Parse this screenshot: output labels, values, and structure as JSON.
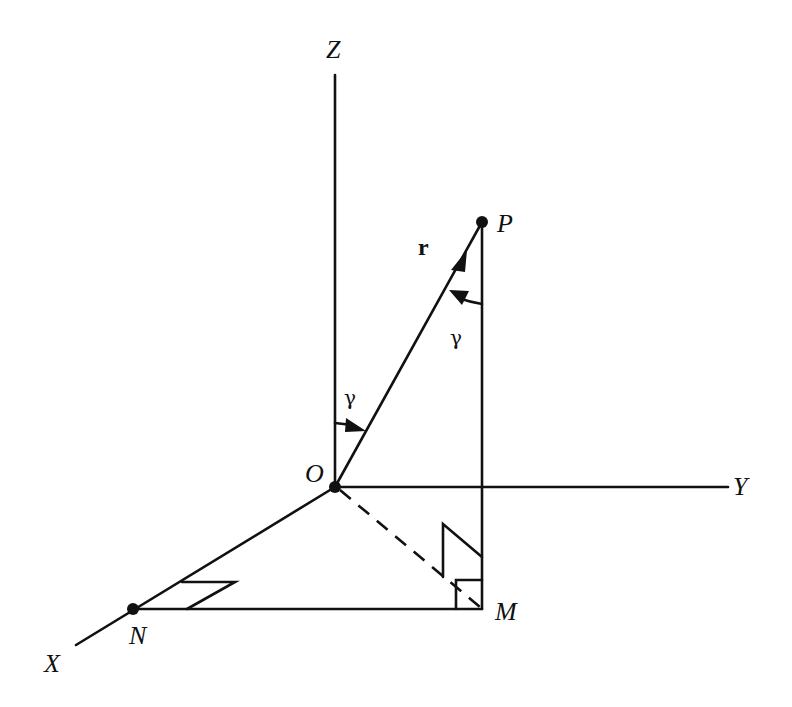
{
  "diagram": {
    "type": "3D coordinate geometry — direction angle gamma",
    "axes": {
      "x_label": "X",
      "y_label": "Y",
      "z_label": "Z"
    },
    "points": {
      "origin": "O",
      "p": "P",
      "m": "M",
      "n": "N"
    },
    "vector_label": "r",
    "angle_label_at_origin": "γ",
    "angle_label_at_p": "γ",
    "colors": {
      "ink": "#111111",
      "background": "#ffffff"
    }
  }
}
